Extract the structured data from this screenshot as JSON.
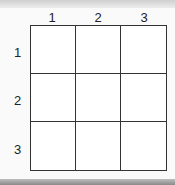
{
  "grid": {
    "rows": 3,
    "cols": 3,
    "column_labels": [
      "1",
      "2",
      "3"
    ],
    "row_labels": [
      "1",
      "2",
      "3"
    ],
    "cells": [
      [
        "",
        "",
        ""
      ],
      [
        "",
        "",
        ""
      ],
      [
        "",
        "",
        ""
      ]
    ],
    "line_color": "#333333"
  }
}
